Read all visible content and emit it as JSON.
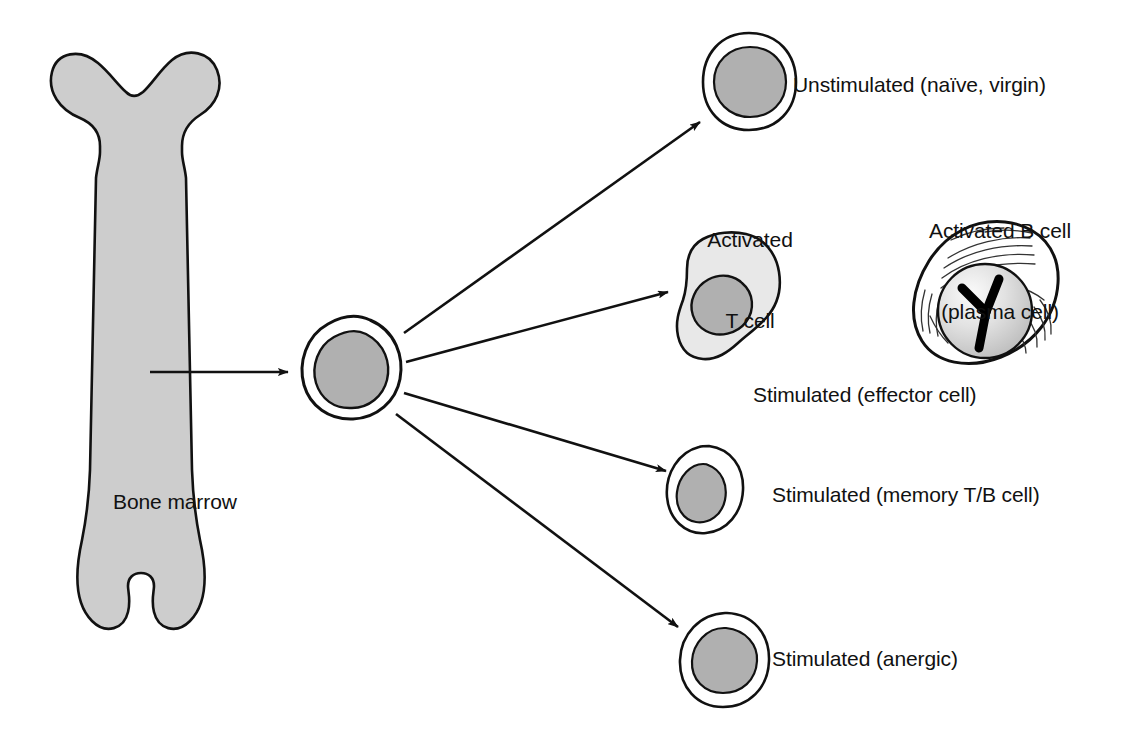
{
  "figure": {
    "background_color": "#ffffff",
    "ink_color": "#111111",
    "bone_fill_color": "#cdcdcd",
    "nucleus_fill_color": "#b0b0b0",
    "cytoplasm_fill_color": "#e8e8e8",
    "membrane_fill_color": "#ffffff"
  },
  "labels": {
    "bone_marrow": "Bone marrow",
    "unstimulated": "Unstimulated (naïve, virgin)",
    "activated_t_line1": "Activated",
    "activated_t_line2": "T cell",
    "activated_b_line1": "Activated B cell",
    "activated_b_line2": "(plasma cell)",
    "effector": "Stimulated (effector cell)",
    "memory": "Stimulated (memory T/B cell)",
    "anergic": "Stimulated (anergic)"
  },
  "nodes": {
    "bone": {
      "name": "long-bone",
      "label": "Bone marrow"
    },
    "stem_cell": {
      "name": "stem-cell",
      "label": ""
    },
    "naive_cell": {
      "name": "unstimulated-lymphocyte",
      "label": "Unstimulated (naïve, virgin)"
    },
    "t_cell": {
      "name": "activated-t-cell",
      "label": "Activated T cell"
    },
    "b_cell": {
      "name": "activated-b-cell",
      "label": "Activated B cell (plasma cell)"
    },
    "memory_cell": {
      "name": "memory-lymphocyte",
      "label": "Stimulated (memory T/B cell)"
    },
    "anergic_cell": {
      "name": "anergic-lymphocyte",
      "label": "Stimulated (anergic)"
    }
  },
  "arrows": [
    {
      "name": "arrow-bone-to-stem",
      "from": "bone",
      "to": "stem_cell",
      "direction": "right"
    },
    {
      "name": "arrow-stem-to-naive",
      "from": "stem_cell",
      "to": "naive_cell",
      "direction": "up-right"
    },
    {
      "name": "arrow-stem-to-effector",
      "from": "stem_cell",
      "to": "t_cell",
      "direction": "up-right"
    },
    {
      "name": "arrow-stem-to-memory",
      "from": "stem_cell",
      "to": "memory_cell",
      "direction": "down-right"
    },
    {
      "name": "arrow-stem-to-anergic",
      "from": "stem_cell",
      "to": "anergic_cell",
      "direction": "down-right"
    }
  ]
}
